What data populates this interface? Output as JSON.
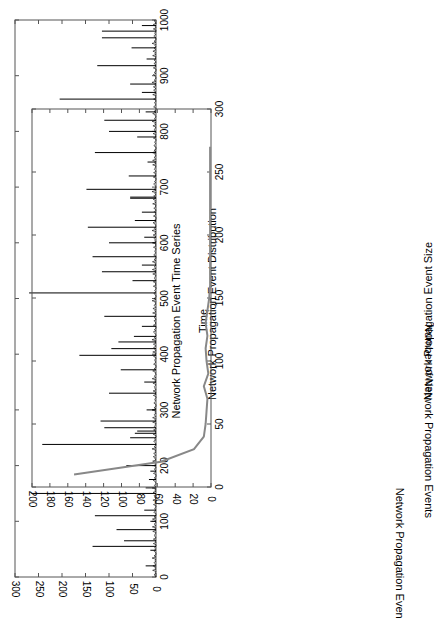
{
  "chart_data": [
    {
      "type": "line",
      "title": "Network Propagation Event Time Series",
      "xlabel": "Time",
      "ylabel": "Network Propagation Event Size",
      "xlim": [
        0,
        1000
      ],
      "ylim": [
        0,
        300
      ],
      "xticks": [
        0,
        100,
        200,
        300,
        400,
        500,
        600,
        700,
        800,
        900,
        1000
      ],
      "yticks": [
        0,
        50,
        100,
        150,
        200,
        250,
        300
      ],
      "grid": false,
      "line_color": "#000000",
      "spikes": {
        "x": [
          20,
          48,
          55,
          65,
          85,
          100,
          110,
          120,
          150,
          160,
          175,
          190,
          200,
          238,
          250,
          258,
          262,
          268,
          280,
          300,
          330,
          350,
          372,
          398,
          410,
          422,
          432,
          450,
          468,
          510,
          532,
          548,
          560,
          575,
          600,
          610,
          628,
          640,
          655,
          680,
          682,
          696,
          720,
          745,
          762,
          790,
          800,
          820,
          835,
          858,
          870,
          885,
          918,
          930,
          950,
          968,
          980,
          990
        ],
        "y": [
          22,
          12,
          135,
          68,
          84,
          12,
          130,
          25,
          265,
          22,
          15,
          12,
          63,
          242,
          55,
          45,
          40,
          110,
          118,
          20,
          100,
          25,
          75,
          163,
          95,
          80,
          47,
          30,
          110,
          270,
          50,
          115,
          30,
          135,
          100,
          25,
          145,
          45,
          30,
          55,
          55,
          148,
          58,
          18,
          130,
          40,
          100,
          110,
          22,
          205,
          30,
          55,
          125,
          20,
          52,
          115,
          115,
          30
        ]
      }
    },
    {
      "type": "line",
      "title": "Network Propagation Event Distribution",
      "xlabel": "Network Propagation Event Size",
      "ylabel": "Number of Network Propagation Events",
      "xlim": [
        0,
        300
      ],
      "ylim": [
        0,
        200
      ],
      "xticks": [
        0,
        50,
        100,
        150,
        200,
        250,
        300
      ],
      "yticks": [
        0,
        20,
        40,
        60,
        80,
        100,
        120,
        140,
        160,
        180,
        200
      ],
      "grid": false,
      "line_color": "#888888",
      "x": [
        10,
        20,
        30,
        40,
        50,
        60,
        70,
        80,
        90,
        100,
        110,
        120,
        130,
        140,
        150,
        160,
        170,
        180,
        190,
        200,
        210,
        220,
        230,
        240,
        250,
        260,
        270
      ],
      "y": [
        153,
        56,
        19,
        8,
        6,
        5,
        4,
        8,
        3,
        5,
        6,
        4,
        6,
        4,
        2,
        1,
        1,
        1,
        1,
        1,
        1,
        1,
        1,
        1,
        1,
        1,
        1
      ]
    }
  ]
}
